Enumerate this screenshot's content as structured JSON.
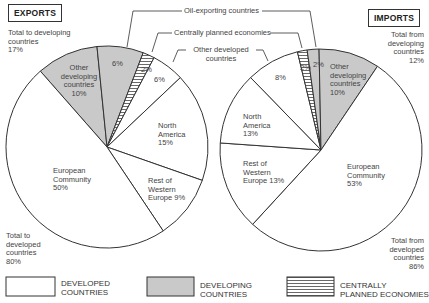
{
  "colors": {
    "developed": "#ffffff",
    "developing": "#c9c9c9",
    "stroke": "#333333",
    "hatch": "#444444"
  },
  "exports": {
    "title": "EXPORTS",
    "total_developing": "Total to developing\ncountries\n17%",
    "total_developed": "Total to\ndeveloped\ncountries\n80%",
    "labels": {
      "other_developing": "Other\ndeveloping\ncountries\n10%",
      "oil_exporting": "6%",
      "centrally_planned": "2%",
      "other_developed": "6%",
      "north_america": "North\nAmerica\n15%",
      "rest_western_europe": "Rest of\nWestern\nEurope 9%",
      "european_community": "European\nCommunity\n50%"
    }
  },
  "imports": {
    "title": "IMPORTS",
    "total_developing": "Total from\ndeveloping\ncountries\n12%",
    "total_developed": "Total from\ndeveloped\ncountries\n86%",
    "labels": {
      "other_developing": "Other\ndeveloping\ncountries\n10%",
      "oil_exporting": "2%",
      "centrally_planned": "2%",
      "other_developed": "8%",
      "north_america": "North\nAmerica\n13%",
      "rest_western_europe": "Rest of\nWestern\nEurope 13%",
      "european_community": "European\nCommunity\n53%"
    }
  },
  "callouts": {
    "oil_exporting": "Oil-exporting countries",
    "centrally_planned": "Centrally planned economies",
    "other_developed": "Other developed\ncountries"
  },
  "legend": {
    "developed": "DEVELOPED\nCOUNTRIES",
    "developing": "DEVELOPING\nCOUNTRIES",
    "centrally_planned": "CENTRALLY\nPLANNED ECONOMIES"
  },
  "chart_data": [
    {
      "type": "pie",
      "title": "EXPORTS",
      "center": [
        107,
        147
      ],
      "radius": 101,
      "slices": [
        {
          "name": "Other developing countries",
          "value": 10,
          "group": "developing",
          "start": -131.3,
          "end": -95.7
        },
        {
          "name": "Oil-exporting countries",
          "value": 6,
          "group": "developing",
          "start": -95.7,
          "end": -69.0
        },
        {
          "name": "Centrally planned economies",
          "value": 2,
          "group": "centrally_planned",
          "start": -69.0,
          "end": -62.2
        },
        {
          "name": "Other developed countries",
          "value": 6,
          "group": "developed",
          "start": -62.2,
          "end": -43.4
        },
        {
          "name": "North America",
          "value": 15,
          "group": "developed",
          "start": -43.4,
          "end": 19.3
        },
        {
          "name": "Rest of Western Europe",
          "value": 9,
          "group": "developed",
          "start": 19.3,
          "end": 56.2
        },
        {
          "name": "European Community",
          "value": 50,
          "group": "developed",
          "start": 56.2,
          "end": 228.7
        }
      ],
      "totals": {
        "developing": 17,
        "developed": 80
      }
    },
    {
      "type": "pie",
      "title": "IMPORTS",
      "center": [
        321,
        150
      ],
      "radius": 101,
      "slices": [
        {
          "name": "Other developed countries",
          "value": 8,
          "group": "developed",
          "start": -134.2,
          "end": -103.5
        },
        {
          "name": "Centrally planned economies",
          "value": 2,
          "group": "centrally_planned",
          "start": -103.5,
          "end": -97.9
        },
        {
          "name": "Oil-exporting countries",
          "value": 2,
          "group": "developing",
          "start": -97.9,
          "end": -91.1
        },
        {
          "name": "Other developing countries",
          "value": 10,
          "group": "developing",
          "start": -91.1,
          "end": -56.0
        },
        {
          "name": "European Community",
          "value": 53,
          "group": "developed",
          "start": -56.0,
          "end": 132.6
        },
        {
          "name": "Rest of Western Europe",
          "value": 13,
          "group": "developed",
          "start": 132.6,
          "end": 184.0
        },
        {
          "name": "North America",
          "value": 13,
          "group": "developed",
          "start": 184.0,
          "end": 225.8
        }
      ],
      "totals": {
        "developing": 12,
        "developed": 86
      }
    }
  ]
}
